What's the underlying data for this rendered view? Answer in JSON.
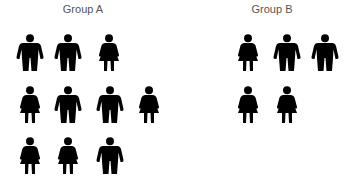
{
  "groups": [
    {
      "label": "Group A",
      "title_center_x": 83,
      "rows": [
        {
          "y": 34,
          "figures": [
            {
              "type": "male",
              "x": 30
            },
            {
              "type": "male",
              "x": 68
            },
            {
              "type": "female",
              "x": 109
            }
          ]
        },
        {
          "y": 86,
          "figures": [
            {
              "type": "female",
              "x": 30
            },
            {
              "type": "male",
              "x": 68
            },
            {
              "type": "male",
              "x": 110
            },
            {
              "type": "female",
              "x": 149
            }
          ]
        },
        {
          "y": 137,
          "figures": [
            {
              "type": "female",
              "x": 30
            },
            {
              "type": "female",
              "x": 68
            },
            {
              "type": "male",
              "x": 110
            }
          ]
        }
      ],
      "counts": {
        "male": 5,
        "female": 5,
        "total": 10
      }
    },
    {
      "label": "Group B",
      "title_center_x": 272,
      "rows": [
        {
          "y": 34,
          "figures": [
            {
              "type": "female",
              "x": 248
            },
            {
              "type": "male",
              "x": 287
            },
            {
              "type": "male",
              "x": 325
            }
          ]
        },
        {
          "y": 86,
          "figures": [
            {
              "type": "female",
              "x": 248
            },
            {
              "type": "female",
              "x": 287
            }
          ]
        }
      ],
      "counts": {
        "male": 2,
        "female": 3,
        "total": 5
      }
    }
  ],
  "icons": {
    "male": "male-person-icon",
    "female": "female-person-icon"
  },
  "colors": {
    "figure": "#000000",
    "title": "#555555",
    "background": "#ffffff"
  }
}
